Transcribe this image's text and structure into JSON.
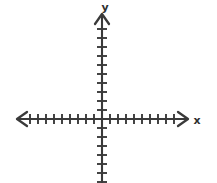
{
  "figure": {
    "background_color": "#ffffff",
    "stroke_color": "#3a3a3a",
    "width": 217,
    "height": 183
  },
  "labels": {
    "y_axis": "y",
    "x_axis": "x"
  },
  "chart_data": {
    "type": "scatter",
    "title": "",
    "subtitle": "",
    "xlabel": "x",
    "ylabel": "y",
    "x": [],
    "y": [],
    "series": [],
    "annotations": [],
    "legend": [],
    "legend_position": "none",
    "grid": false,
    "axes_style": "hand-drawn cartesian axes with tick marks, no numeric tick labels",
    "origin_px": [
      102,
      119
    ],
    "x_axis_px": {
      "start": 17,
      "end": 188,
      "y": 119
    },
    "y_axis_px": {
      "top": 14,
      "bottom": 183,
      "x": 102
    },
    "x_tick_spacing_px": 8,
    "y_tick_spacing_px": 9,
    "x_ticks_negative_count": 10,
    "x_ticks_positive_count": 10,
    "y_ticks_positive_count": 10,
    "y_ticks_negative_count": 7,
    "x_tick_half_length_px": 5,
    "y_tick_half_length_px": 5,
    "arrowheads": [
      "x-negative",
      "x-positive",
      "y-positive"
    ],
    "xlim": [
      -10,
      10
    ],
    "ylim": [
      -7,
      10
    ],
    "tick_labels_x": [],
    "tick_labels_y": []
  }
}
